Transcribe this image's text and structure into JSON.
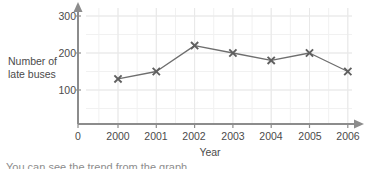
{
  "chart_data": {
    "type": "line",
    "title": "",
    "subtitle": "",
    "xlabel": "Year",
    "ylabel": "Number of\nlate buses",
    "categories": [
      "2000",
      "2001",
      "2002",
      "2003",
      "2004",
      "2005",
      "2006"
    ],
    "x": [
      2000,
      2001,
      2002,
      2003,
      2004,
      2005,
      2006
    ],
    "values": [
      130,
      150,
      220,
      200,
      180,
      200,
      150
    ],
    "series": [
      {
        "name": "Number of late buses",
        "values": [
          130,
          150,
          220,
          200,
          180,
          200,
          150
        ]
      }
    ],
    "ylim": [
      0,
      320
    ],
    "xlim": [
      1999.0,
      2006.6
    ],
    "yticks": [
      "100",
      "200",
      "300"
    ],
    "ytick_values": [
      100,
      200,
      300
    ],
    "xticks": [
      "0",
      "2000",
      "2001",
      "2002",
      "2003",
      "2004",
      "2005",
      "2006"
    ],
    "grid": true,
    "grid_minor_step": 50,
    "legend": "none",
    "marker": "cross",
    "colors": {
      "line": "#6e6e6e",
      "marker": "#5f5f5f",
      "axis": "#8c8c8c",
      "grid": "#e8e8e8",
      "grid_minor": "#f1f1f1",
      "text": "#4b4b4b",
      "background": "#ffffff"
    }
  },
  "caption": {
    "text": "You can see the trend from the graph."
  }
}
